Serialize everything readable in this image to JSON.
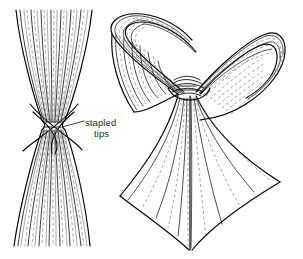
{
  "figure": {
    "background_color": "#ffffff",
    "ink_color": "#1a1a1a",
    "width": 303,
    "height": 259
  },
  "annotations": [
    {
      "id": "stapled-tips",
      "line_1": "stapled",
      "line_2": "tips",
      "text": "stapled tips",
      "text_color": "#2b2b2b",
      "font_size_px": 9.5,
      "text_x": 85,
      "text_y": 117,
      "leader": {
        "from_x": 85,
        "from_y": 121,
        "to_x": 62,
        "to_y": 127
      }
    }
  ],
  "left_figure": {
    "name": "straight-bundle",
    "label": "fiber bundle pinched at stapled waist",
    "top_left_x": 16,
    "top_right_x": 92,
    "top_y": 10,
    "bottom_left_x": 14,
    "bottom_right_x": 90,
    "bottom_y": 246,
    "waist_x": 53,
    "waist_y": 125,
    "waist_half_width": 11,
    "fiber_count": 34
  },
  "right_figure": {
    "name": "curled-bundle",
    "label": "same bundle curled into two loops above the stapled waist",
    "stem_tip_x": 190,
    "stem_tip_y": 250,
    "pinch_x": 186,
    "pinch_y": 86,
    "left_loop_extent_x": 112,
    "right_loop_extent_x": 286,
    "top_y": 12,
    "fiber_count": 30
  }
}
